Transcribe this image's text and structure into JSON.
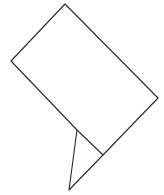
{
  "canvas": {
    "width": 164,
    "height": 195,
    "background": "#ffffff"
  },
  "stroke": {
    "color": "#2a2a2a",
    "width": 1.1
  },
  "shapes": {
    "rectangle": {
      "points": "65,4 11,61 77,130 103,155 158,98"
    },
    "triangle": {
      "points": "77,130 69,190 103,155"
    }
  }
}
